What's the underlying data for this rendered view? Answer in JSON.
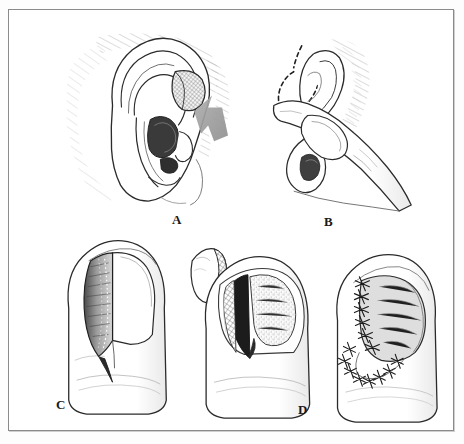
{
  "figure": {
    "style": "pen-and-ink medical line drawing",
    "border_color": "#8a8a8a",
    "ink_color": "#1a1a1a",
    "arrow_color": "#9a9a9a",
    "background_color": "#ffffff",
    "panel_count": 4
  },
  "panels": [
    {
      "id": "A",
      "label": "A",
      "subject": "ear",
      "caption_text": "A",
      "description": "Lateral view of external ear with shaded donor site marked on the antihelix and a gray arrow indicating the harvest location",
      "elements": [
        {
          "name": "ear-outline",
          "kind": "anatomy"
        },
        {
          "name": "donor-site-hatch",
          "kind": "graft-donor-area"
        },
        {
          "name": "indicator-arrow",
          "kind": "arrow",
          "color": "#9a9a9a"
        },
        {
          "name": "hair-shading",
          "kind": "hatching"
        }
      ]
    },
    {
      "id": "B",
      "label": "B",
      "subject": "ear-with-finger",
      "caption_text": "B",
      "description": "Ear supported from behind by the surgeon's finger with a dashed incision outline drawn anterior to the helix",
      "elements": [
        {
          "name": "ear-outline",
          "kind": "anatomy"
        },
        {
          "name": "supporting-finger",
          "kind": "anatomy"
        },
        {
          "name": "dashed-incision-outline",
          "kind": "marking"
        },
        {
          "name": "hair-shading",
          "kind": "hatching"
        }
      ]
    },
    {
      "id": "C",
      "label": "C",
      "subject": "fingertip-defect",
      "caption_text": "C",
      "description": "Fingertip with nail plate elevated showing the nail bed defect with dotted margin",
      "elements": [
        {
          "name": "finger-outline",
          "kind": "anatomy"
        },
        {
          "name": "nail-plate",
          "kind": "anatomy"
        },
        {
          "name": "nail-bed-defect",
          "kind": "wound"
        },
        {
          "name": "defect-margin-dots",
          "kind": "marking"
        }
      ]
    },
    {
      "id": "graft",
      "label": "",
      "subject": "harvested-composite-graft",
      "caption_text": "",
      "description": "Small harvested composite ear graft shown separately with cross-hatched cartilage edge",
      "elements": [
        {
          "name": "graft-outline",
          "kind": "tissue"
        },
        {
          "name": "cartilage-crosshatch",
          "kind": "hatching"
        }
      ]
    },
    {
      "id": "C2",
      "label": "",
      "subject": "fingertip-graft-inset",
      "caption_text": "",
      "description": "Fingertip with nail plate removed, defect exposed and stippled graft bed prepared",
      "elements": [
        {
          "name": "finger-outline",
          "kind": "anatomy"
        },
        {
          "name": "exposed-nail-bed",
          "kind": "wound"
        },
        {
          "name": "stippled-graft-bed",
          "kind": "tissue"
        },
        {
          "name": "dark-proximal-shadow",
          "kind": "shading"
        }
      ]
    },
    {
      "id": "D",
      "label": "D",
      "subject": "fingertip-sutured",
      "caption_text": "D",
      "description": "Fingertip with composite graft inset and secured by interrupted sutures along the nail bed and lateral margins",
      "elements": [
        {
          "name": "finger-outline",
          "kind": "anatomy"
        },
        {
          "name": "inset-graft",
          "kind": "tissue"
        },
        {
          "name": "interrupted-sutures",
          "kind": "sutures"
        }
      ]
    }
  ],
  "labels": {
    "a": "A",
    "b": "B",
    "c": "C",
    "d": "D"
  }
}
